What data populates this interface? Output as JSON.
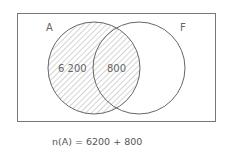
{
  "diagram": {
    "type": "venn",
    "sets": [
      {
        "id": "A",
        "label": "A",
        "shaded": true
      },
      {
        "id": "F",
        "label": "F",
        "shaded": false
      }
    ],
    "regions": [
      {
        "id": "A-only",
        "value": "6 200"
      },
      {
        "id": "A-and-F",
        "value": "800"
      }
    ],
    "colors": {
      "stroke": "#666666",
      "hatch": "#9a9a9a",
      "text": "#555555"
    }
  },
  "equation": {
    "line1": "n(A) = 6200 + 800",
    "line2": "= 7000"
  }
}
